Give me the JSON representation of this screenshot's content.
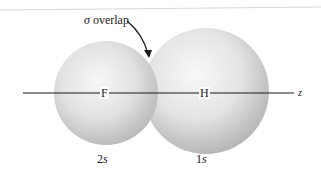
{
  "diagram": {
    "annotation": {
      "symbol": "σ",
      "text": "overlap"
    },
    "axis": {
      "label": "z"
    },
    "atoms": [
      {
        "symbol": "F",
        "orbital_number": "2",
        "orbital_letter": "s"
      },
      {
        "symbol": "H",
        "orbital_number": "1",
        "orbital_letter": "s"
      }
    ],
    "colors": {
      "sphere_highlight": "#fafafa",
      "sphere_shadow": "#b4b4b4",
      "line": "#1a1a1a",
      "background": "#ffffff"
    }
  }
}
